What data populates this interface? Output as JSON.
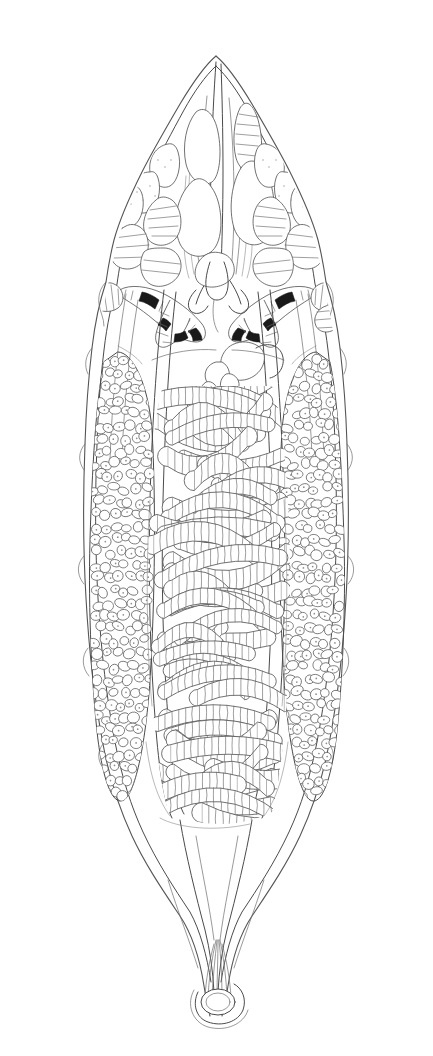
{
  "figure": {
    "background_color": "#ffffff",
    "line_color": "#4a4a4a",
    "dark_structure_color": "#1a1a1a",
    "width_px": 433,
    "height_px": 1056,
    "technique": "ink line drawing with stipple shading"
  },
  "body_outline": {
    "name": "body-outline",
    "shape": "elongate lanceolate with pointed anterior and tapering caudal appendage",
    "anterior_tip_y": 55,
    "posterior_tip_y": 1022,
    "widest_y": 560,
    "widest_width_px": 330,
    "outline_style": "double contour line"
  },
  "regions": [
    {
      "key": "anterior-cone",
      "label": "Anterior cone",
      "y_start": 55,
      "y_end": 250
    },
    {
      "key": "dark-band-zone",
      "label": "Dark banded organs",
      "y_start": 250,
      "y_end": 340
    },
    {
      "key": "vitellaria-zone",
      "label": "Vitelline fields",
      "y_start": 350,
      "y_end": 800
    },
    {
      "key": "uterine-coil-zone",
      "label": "Uterine coils",
      "y_start": 380,
      "y_end": 820
    },
    {
      "key": "caudal-appendage",
      "label": "Caudal appendage",
      "y_start": 820,
      "y_end": 1022
    }
  ],
  "structures": [
    {
      "key": "anterior-gland-branches",
      "label": "Branching anterior glands",
      "count": 16,
      "shading": "stipple",
      "side": "both"
    },
    {
      "key": "pharyngeal-striations",
      "label": "Longitudinal pharyngeal striations",
      "count": 9,
      "side": "median"
    },
    {
      "key": "dark-caeca-left",
      "label": "Pigmented caecal branch (left)",
      "side": "left"
    },
    {
      "key": "dark-caeca-right",
      "label": "Pigmented caecal branch (right)",
      "side": "right"
    },
    {
      "key": "vitellarium-left",
      "label": "Left vitellarium",
      "follicle_count": 210,
      "side": "left"
    },
    {
      "key": "vitellarium-right",
      "label": "Right vitellarium",
      "follicle_count": 210,
      "side": "right"
    },
    {
      "key": "ovary",
      "label": "Lobed ovary",
      "side": "median",
      "y": 372
    },
    {
      "key": "seminal-vesicle",
      "label": "Seminal vesicle",
      "side": "median",
      "y": 360
    },
    {
      "key": "uterus",
      "label": "Coiled uterus",
      "coil_count": 34,
      "side": "median"
    },
    {
      "key": "excretory-pore",
      "label": "Terminal excretory pore",
      "side": "median",
      "y": 1000
    },
    {
      "key": "caudal-fibres",
      "label": "Radiating caudal fibres",
      "count": 7,
      "side": "median"
    }
  ],
  "legend": {
    "visible": false,
    "items": []
  },
  "labels": {
    "visible": false,
    "text_present": "none"
  }
}
